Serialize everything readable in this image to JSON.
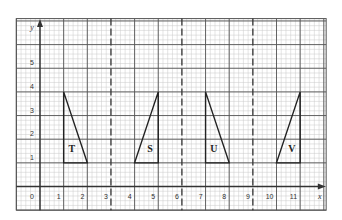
{
  "figure": {
    "axes": {
      "x_label": "x",
      "y_label": "y",
      "origin_label": "0",
      "x_ticks": [
        "1",
        "2",
        "3",
        "4",
        "5",
        "6",
        "7",
        "8",
        "9",
        "10",
        "11"
      ],
      "y_ticks": [
        "1",
        "2",
        "3",
        "4",
        "5"
      ]
    },
    "grid": {
      "x_min": -1,
      "x_max": 12.1,
      "y_min": -1,
      "y_max": 7.1,
      "minor_divisions": 5,
      "minor_color": "#c8c8c8",
      "major_color": "#555555",
      "line_color": "#333333"
    },
    "dashed_lines_x": [
      3,
      6,
      9
    ],
    "shapes": [
      {
        "label": "T",
        "points": [
          [
            1,
            4
          ],
          [
            1,
            1
          ],
          [
            2,
            1
          ]
        ],
        "label_pos": [
          1.35,
          1.6
        ]
      },
      {
        "label": "S",
        "points": [
          [
            5,
            4
          ],
          [
            4,
            1
          ],
          [
            5,
            1
          ]
        ],
        "label_pos": [
          4.65,
          1.6
        ]
      },
      {
        "label": "U",
        "points": [
          [
            7,
            4
          ],
          [
            7,
            1
          ],
          [
            8,
            1
          ]
        ],
        "label_pos": [
          7.35,
          1.6
        ]
      },
      {
        "label": "V",
        "points": [
          [
            11,
            4
          ],
          [
            10,
            1
          ],
          [
            11,
            1
          ]
        ],
        "label_pos": [
          10.65,
          1.6
        ]
      }
    ]
  }
}
